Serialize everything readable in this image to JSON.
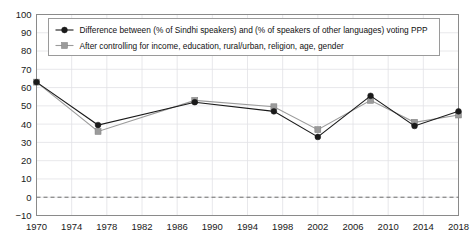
{
  "chart_data": {
    "type": "line",
    "title": "",
    "xlabel": "",
    "ylabel": "",
    "xlim": [
      1970,
      2018
    ],
    "ylim": [
      -10,
      100
    ],
    "grid": true,
    "legend_position": "top-left",
    "xticks": [
      "1970",
      "1974",
      "1978",
      "1982",
      "1986",
      "1990",
      "1994",
      "1998",
      "2002",
      "2006",
      "2010",
      "2014",
      "2018"
    ],
    "yticks": [
      "100",
      "90",
      "80",
      "70",
      "60",
      "50",
      "40",
      "30",
      "20",
      "10",
      "0",
      "-10"
    ],
    "x": [
      1970,
      1977,
      1988,
      1997,
      2002,
      2008,
      2013,
      2018
    ],
    "annotations": [
      {
        "name": "zero-reference-line",
        "y": 0,
        "style": "dashed"
      }
    ],
    "series": [
      {
        "name": "Difference between (% of Sindhi speakers) and (% of speakers of other languages) voting PPP",
        "marker": "circle",
        "color": "#1a1a1a",
        "values": [
          63,
          39.5,
          52,
          47,
          33,
          55.5,
          39,
          47
        ]
      },
      {
        "name": "After controlling for income, education, rural/urban, religion, age, gender",
        "marker": "square",
        "color": "#9b9b9b",
        "values": [
          63,
          36,
          53,
          49.5,
          37,
          53,
          41,
          45
        ]
      }
    ]
  },
  "legend": {
    "entries": [
      {
        "label": "Difference between (% of Sindhi speakers) and (% of speakers of other languages) voting PPP",
        "marker": "circle-marker",
        "color": "#1a1a1a"
      },
      {
        "label": "After controlling for income, education, rural/urban, religion, age, gender",
        "marker": "square-marker",
        "color": "#9b9b9b"
      }
    ]
  },
  "colors": {
    "series_primary": "#1a1a1a",
    "series_secondary": "#9b9b9b",
    "grid": "#e2e2e6",
    "spine": "#8a8a8a",
    "background": "#ffffff"
  }
}
